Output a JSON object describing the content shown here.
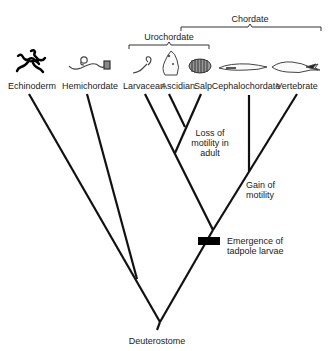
{
  "diagram": {
    "type": "phylogenetic-tree",
    "root": "Deuterostome",
    "groups": [
      {
        "name": "Chordate",
        "members": [
          "Larvacean",
          "Ascidian",
          "Salp",
          "Cephalochordate",
          "Vertebrate"
        ]
      },
      {
        "name": "Urochordate",
        "members": [
          "Larvacean",
          "Ascidian",
          "Salp"
        ]
      }
    ],
    "taxa": [
      {
        "name": "Echinoderm",
        "icon": "echinoderm-icon"
      },
      {
        "name": "Hemichordate",
        "icon": "hemichordate-icon"
      },
      {
        "name": "Larvacean",
        "icon": "larvacean-icon"
      },
      {
        "name": "Ascidian",
        "icon": "ascidian-icon"
      },
      {
        "name": "Salp",
        "icon": "salp-icon"
      },
      {
        "name": "Cephalochordate",
        "icon": "cephalochordate-icon"
      },
      {
        "name": "Vertebrate",
        "icon": "vertebrate-icon"
      }
    ],
    "events": [
      {
        "id": "loss",
        "lines": [
          "Loss of",
          "motility in",
          "adult"
        ]
      },
      {
        "id": "gain",
        "lines": [
          "Gain of",
          "motility"
        ]
      },
      {
        "id": "tadpole",
        "lines": [
          "Emergence of",
          "tadpole larvae"
        ]
      }
    ],
    "colors": {
      "line": "#111111",
      "text": "#222222",
      "marker": "#000000"
    }
  }
}
